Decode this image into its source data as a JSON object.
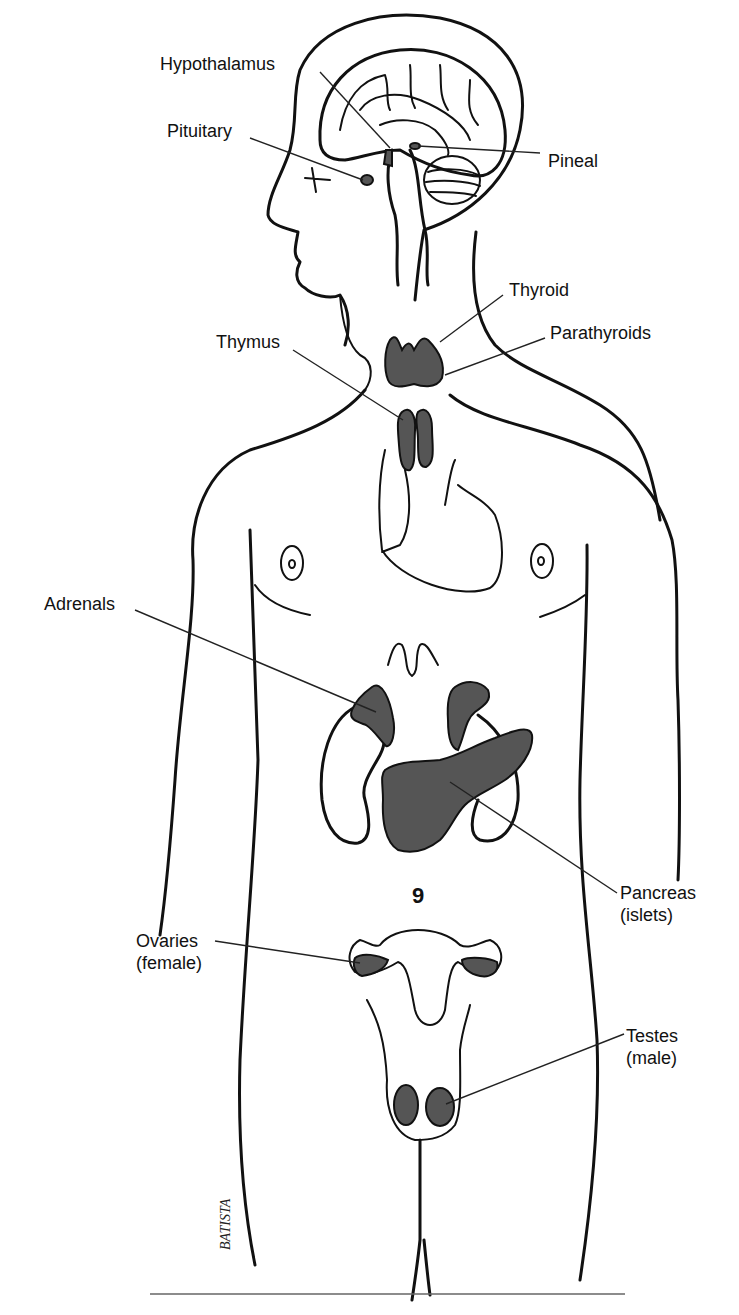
{
  "diagram": {
    "colors": {
      "line": "#111111",
      "gland_fill": "#555555",
      "background": "#ffffff"
    },
    "labels": {
      "hypothalamus": "Hypothalamus",
      "pituitary": "Pituitary",
      "pineal": "Pineal",
      "thyroid": "Thyroid",
      "parathyroids": "Parathyroids",
      "thymus": "Thymus",
      "adrenals": "Adrenals",
      "pancreas_line1": "Pancreas",
      "pancreas_line2": "(islets)",
      "ovaries_line1": "Ovaries",
      "ovaries_line2": "(female)",
      "testes_line1": "Testes",
      "testes_line2": "(male)"
    },
    "signature": "BATISTA"
  }
}
